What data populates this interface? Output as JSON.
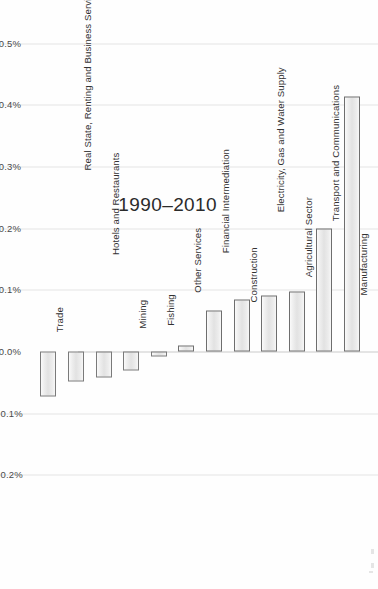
{
  "chart_data": {
    "type": "bar",
    "title": "1990–2010",
    "xlabel": "",
    "ylabel": "",
    "orientation": "vertical-rotated-90",
    "grid": true,
    "legend": "none",
    "ylim": [
      -0.25,
      0.55
    ],
    "ytick_labels": [
      "0.5%",
      "0.4%",
      "0.3%",
      "0.2%",
      "0.1%",
      "0.0%",
      "-0.1%",
      "-0.2%"
    ],
    "ytick_values": [
      0.5,
      0.4,
      0.3,
      0.2,
      0.1,
      0.0,
      -0.1,
      -0.2
    ],
    "unit": "%",
    "categories": [
      "Manufacturing",
      "Transport and Communications",
      "Agricultural Sector",
      "Electricity, Gas and Water Supply",
      "Construction",
      "Financial Intermediation",
      "Other Services",
      "Fishing",
      "Mining",
      "Hotels and Restaurants",
      "Real State, Renting and Business Services",
      "Trade"
    ],
    "values": [
      0.413,
      0.2,
      0.098,
      0.091,
      0.084,
      0.066,
      0.009,
      -0.008,
      -0.031,
      -0.042,
      -0.049,
      -0.073
    ]
  },
  "axis": {
    "tick0": "0.5%",
    "tick1": "0.4%",
    "tick2": "0.3%",
    "tick3": "0.2%",
    "tick4": "0.1%",
    "tick5": "0.0%",
    "tick6": "-0.1%",
    "tick7": "-0.2%"
  },
  "colors": {
    "bar_fill": "#eaeaea",
    "bar_stroke": "#6e6e6e",
    "gridline": "#e4e4e4",
    "zero_line": "#c9c9c9",
    "text": "#323232",
    "background": "#fefefe"
  }
}
